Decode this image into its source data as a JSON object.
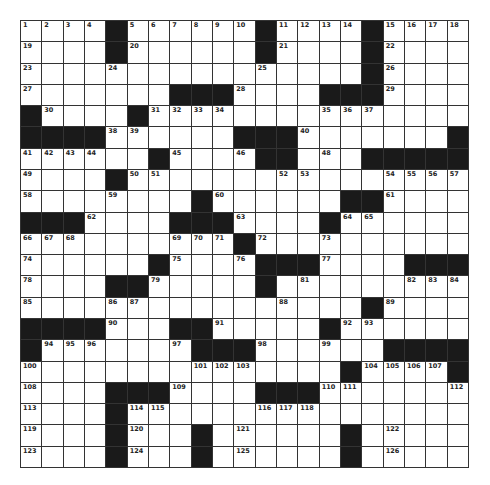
{
  "puzzle": {
    "rows": 21,
    "cols": 21,
    "colors": {
      "block": "#1a1a1a",
      "cell": "#ffffff",
      "line": "#333333",
      "number": "#222222"
    },
    "grid": [
      "....#......#....#....",
      "....#......#....#....",
      "................#....",
      ".......###....###....",
      "#....#...............",
      "####......###.......#",
      "......#....##...#####",
      "....#................",
      "........#......##....",
      "###....###....#......",
      "..........#..........",
      "......#....###....###",
      "....##.....#.........",
      "................#....",
      "####...##.....#......",
      "#.......###......####",
      "...............#....#",
      "....###....###.......",
      "....#................",
      "....#...#......#.....",
      "....#...#......#....."
    ],
    "numbers": [
      {
        "r": 0,
        "c": 0,
        "n": "1"
      },
      {
        "r": 0,
        "c": 1,
        "n": "2"
      },
      {
        "r": 0,
        "c": 2,
        "n": "3"
      },
      {
        "r": 0,
        "c": 3,
        "n": "4"
      },
      {
        "r": 0,
        "c": 5,
        "n": "5"
      },
      {
        "r": 0,
        "c": 6,
        "n": "6"
      },
      {
        "r": 0,
        "c": 7,
        "n": "7"
      },
      {
        "r": 0,
        "c": 8,
        "n": "8"
      },
      {
        "r": 0,
        "c": 9,
        "n": "9"
      },
      {
        "r": 0,
        "c": 10,
        "n": "10"
      },
      {
        "r": 0,
        "c": 12,
        "n": "11"
      },
      {
        "r": 0,
        "c": 13,
        "n": "12"
      },
      {
        "r": 0,
        "c": 14,
        "n": "13"
      },
      {
        "r": 0,
        "c": 15,
        "n": "14"
      },
      {
        "r": 0,
        "c": 17,
        "n": "15"
      },
      {
        "r": 0,
        "c": 18,
        "n": "16"
      },
      {
        "r": 0,
        "c": 19,
        "n": "17"
      },
      {
        "r": 0,
        "c": 20,
        "n": "18"
      },
      {
        "r": 1,
        "c": 0,
        "n": "19"
      },
      {
        "r": 1,
        "c": 5,
        "n": "20"
      },
      {
        "r": 1,
        "c": 12,
        "n": "21"
      },
      {
        "r": 1,
        "c": 17,
        "n": "22"
      },
      {
        "r": 2,
        "c": 0,
        "n": "23"
      },
      {
        "r": 2,
        "c": 4,
        "n": "24"
      },
      {
        "r": 2,
        "c": 11,
        "n": "25"
      },
      {
        "r": 2,
        "c": 17,
        "n": "26"
      },
      {
        "r": 3,
        "c": 0,
        "n": "27"
      },
      {
        "r": 3,
        "c": 10,
        "n": "28"
      },
      {
        "r": 3,
        "c": 17,
        "n": "29"
      },
      {
        "r": 4,
        "c": 1,
        "n": "30"
      },
      {
        "r": 4,
        "c": 6,
        "n": "31"
      },
      {
        "r": 4,
        "c": 7,
        "n": "32"
      },
      {
        "r": 4,
        "c": 8,
        "n": "33"
      },
      {
        "r": 4,
        "c": 9,
        "n": "34"
      },
      {
        "r": 4,
        "c": 14,
        "n": "35"
      },
      {
        "r": 4,
        "c": 15,
        "n": "36"
      },
      {
        "r": 4,
        "c": 16,
        "n": "37"
      },
      {
        "r": 5,
        "c": 4,
        "n": "38"
      },
      {
        "r": 5,
        "c": 5,
        "n": "39"
      },
      {
        "r": 5,
        "c": 13,
        "n": "40"
      },
      {
        "r": 6,
        "c": 0,
        "n": "41"
      },
      {
        "r": 6,
        "c": 1,
        "n": "42"
      },
      {
        "r": 6,
        "c": 2,
        "n": "43"
      },
      {
        "r": 6,
        "c": 3,
        "n": "44"
      },
      {
        "r": 6,
        "c": 7,
        "n": "45"
      },
      {
        "r": 6,
        "c": 10,
        "n": "46"
      },
      {
        "r": 6,
        "c": 11,
        "n": "47"
      },
      {
        "r": 6,
        "c": 14,
        "n": "48"
      },
      {
        "r": 7,
        "c": 0,
        "n": "49"
      },
      {
        "r": 7,
        "c": 5,
        "n": "50"
      },
      {
        "r": 7,
        "c": 6,
        "n": "51"
      },
      {
        "r": 7,
        "c": 12,
        "n": "52"
      },
      {
        "r": 7,
        "c": 13,
        "n": "53"
      },
      {
        "r": 7,
        "c": 17,
        "n": "54"
      },
      {
        "r": 7,
        "c": 18,
        "n": "55"
      },
      {
        "r": 7,
        "c": 19,
        "n": "56"
      },
      {
        "r": 7,
        "c": 20,
        "n": "57"
      },
      {
        "r": 8,
        "c": 0,
        "n": "58"
      },
      {
        "r": 8,
        "c": 4,
        "n": "59"
      },
      {
        "r": 8,
        "c": 9,
        "n": "60"
      },
      {
        "r": 8,
        "c": 17,
        "n": "61"
      },
      {
        "r": 9,
        "c": 3,
        "n": "62"
      },
      {
        "r": 9,
        "c": 10,
        "n": "63"
      },
      {
        "r": 9,
        "c": 15,
        "n": "64"
      },
      {
        "r": 9,
        "c": 16,
        "n": "65"
      },
      {
        "r": 10,
        "c": 0,
        "n": "66"
      },
      {
        "r": 10,
        "c": 1,
        "n": "67"
      },
      {
        "r": 10,
        "c": 2,
        "n": "68"
      },
      {
        "r": 10,
        "c": 7,
        "n": "69"
      },
      {
        "r": 10,
        "c": 8,
        "n": "70"
      },
      {
        "r": 10,
        "c": 9,
        "n": "71"
      },
      {
        "r": 10,
        "c": 11,
        "n": "72"
      },
      {
        "r": 10,
        "c": 14,
        "n": "73"
      },
      {
        "r": 11,
        "c": 0,
        "n": "74"
      },
      {
        "r": 11,
        "c": 7,
        "n": "75"
      },
      {
        "r": 11,
        "c": 10,
        "n": "76"
      },
      {
        "r": 11,
        "c": 14,
        "n": "77"
      },
      {
        "r": 12,
        "c": 0,
        "n": "78"
      },
      {
        "r": 12,
        "c": 6,
        "n": "79"
      },
      {
        "r": 12,
        "c": 11,
        "n": "80"
      },
      {
        "r": 12,
        "c": 13,
        "n": "81"
      },
      {
        "r": 12,
        "c": 18,
        "n": "82"
      },
      {
        "r": 12,
        "c": 19,
        "n": "83"
      },
      {
        "r": 12,
        "c": 20,
        "n": "84"
      },
      {
        "r": 13,
        "c": 0,
        "n": "85"
      },
      {
        "r": 13,
        "c": 4,
        "n": "86"
      },
      {
        "r": 13,
        "c": 5,
        "n": "87"
      },
      {
        "r": 13,
        "c": 12,
        "n": "88"
      },
      {
        "r": 13,
        "c": 17,
        "n": "89"
      },
      {
        "r": 14,
        "c": 4,
        "n": "90"
      },
      {
        "r": 14,
        "c": 9,
        "n": "91"
      },
      {
        "r": 14,
        "c": 15,
        "n": "92"
      },
      {
        "r": 14,
        "c": 16,
        "n": "93"
      },
      {
        "r": 15,
        "c": 1,
        "n": "94"
      },
      {
        "r": 15,
        "c": 2,
        "n": "95"
      },
      {
        "r": 15,
        "c": 3,
        "n": "96"
      },
      {
        "r": 15,
        "c": 7,
        "n": "97"
      },
      {
        "r": 15,
        "c": 11,
        "n": "98"
      },
      {
        "r": 15,
        "c": 14,
        "n": "99"
      },
      {
        "r": 16,
        "c": 0,
        "n": "100"
      },
      {
        "r": 16,
        "c": 8,
        "n": "101"
      },
      {
        "r": 16,
        "c": 9,
        "n": "102"
      },
      {
        "r": 16,
        "c": 10,
        "n": "103"
      },
      {
        "r": 16,
        "c": 16,
        "n": "104"
      },
      {
        "r": 16,
        "c": 17,
        "n": "105"
      },
      {
        "r": 16,
        "c": 18,
        "n": "106"
      },
      {
        "r": 16,
        "c": 19,
        "n": "107"
      },
      {
        "r": 17,
        "c": 0,
        "n": "108"
      },
      {
        "r": 17,
        "c": 7,
        "n": "109"
      },
      {
        "r": 17,
        "c": 14,
        "n": "110"
      },
      {
        "r": 17,
        "c": 15,
        "n": "111"
      },
      {
        "r": 17,
        "c": 20,
        "n": "112"
      },
      {
        "r": 18,
        "c": 0,
        "n": "113"
      },
      {
        "r": 18,
        "c": 5,
        "n": "114"
      },
      {
        "r": 18,
        "c": 6,
        "n": "115"
      },
      {
        "r": 18,
        "c": 11,
        "n": "116"
      },
      {
        "r": 18,
        "c": 12,
        "n": "117"
      },
      {
        "r": 18,
        "c": 13,
        "n": "118"
      },
      {
        "r": 19,
        "c": 0,
        "n": "119"
      },
      {
        "r": 19,
        "c": 5,
        "n": "120"
      },
      {
        "r": 19,
        "c": 10,
        "n": "121"
      },
      {
        "r": 19,
        "c": 17,
        "n": "122"
      },
      {
        "r": 20,
        "c": 0,
        "n": "123"
      },
      {
        "r": 20,
        "c": 5,
        "n": "124"
      },
      {
        "r": 20,
        "c": 10,
        "n": "125"
      },
      {
        "r": 20,
        "c": 17,
        "n": "126"
      }
    ]
  }
}
